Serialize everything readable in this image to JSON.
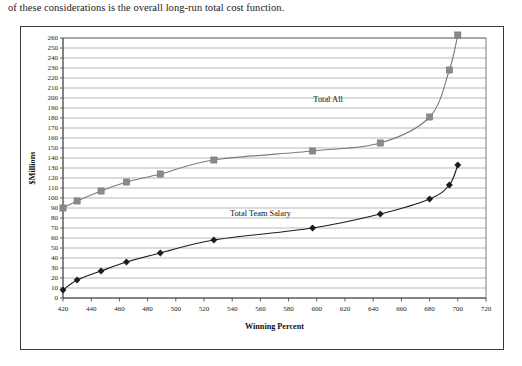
{
  "caption": {
    "text": "of these considerations is the overall long-run total cost function."
  },
  "figure": {
    "frame_color": "#3a3a3a",
    "shadow_color": "#8e8e8e",
    "background": "#ffffff"
  },
  "chart_data": {
    "type": "line",
    "title": "",
    "subtitle": "",
    "xlabel": "Winning Percent",
    "ylabel": "$Millions",
    "xlim": [
      420,
      720
    ],
    "ylim": [
      0,
      260
    ],
    "xticks": [
      420,
      440,
      460,
      480,
      500,
      520,
      540,
      560,
      580,
      600,
      620,
      640,
      660,
      680,
      700,
      720
    ],
    "yticks": [
      0,
      10,
      20,
      30,
      40,
      50,
      60,
      70,
      80,
      90,
      100,
      110,
      120,
      130,
      140,
      150,
      160,
      170,
      180,
      190,
      200,
      210,
      220,
      230,
      240,
      250,
      260
    ],
    "grid": true,
    "grid_axis": "y",
    "legend": "inline-annotation",
    "series": [
      {
        "name": "Total All",
        "marker": "square",
        "color": "#8a8a8a",
        "line_color": "#7a7a7a",
        "annotation": "Total All",
        "annotation_x": 608,
        "annotation_y": 196,
        "x": [
          420,
          430,
          447,
          465,
          489,
          527,
          597,
          645,
          680,
          694,
          700
        ],
        "values": [
          90,
          97,
          107,
          116,
          124,
          138,
          147,
          155,
          181,
          228,
          263
        ]
      },
      {
        "name": "Total Team Salary",
        "marker": "diamond",
        "color": "#1c1c1c",
        "line_color": "#1c1c1c",
        "annotation": "Total Team Salary",
        "annotation_x": 560,
        "annotation_y": 82,
        "x": [
          420,
          430,
          447,
          465,
          489,
          527,
          597,
          645,
          680,
          694,
          700
        ],
        "values": [
          8,
          18,
          27,
          36,
          45,
          58,
          70,
          84,
          99,
          113,
          133
        ]
      }
    ]
  }
}
